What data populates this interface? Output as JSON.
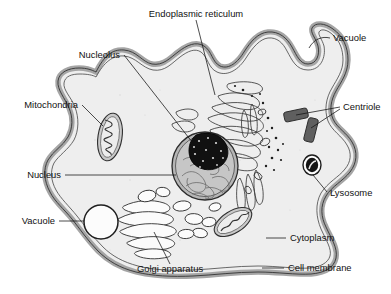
{
  "diagram": {
    "background_color": "#ffffff",
    "cytoplasm_color": "#eeeeee",
    "membrane_color": "#9a9a9a",
    "outline_color": "#333333",
    "nucleolus_color": "#111111",
    "nucleus_color": "#b9b9b9"
  },
  "labels": {
    "endoplasmic_reticulum": "Endoplasmic reticulum",
    "nucleolus": "Nucleolus",
    "mitochondria": "Mitochondria",
    "nucleus": "Nucleus",
    "vacuole_left": "Vacuole",
    "golgi_apparatus": "Golgi apparatus",
    "vacuole_top": "Vacuole",
    "centriole": "Centriole",
    "lysosome": "Lysosome",
    "cytoplasm": "Cytoplasm",
    "cell_membrane": "Cell membrane"
  },
  "parts": [
    {
      "id": "endoplasmic-reticulum",
      "label": "Endoplasmic reticulum",
      "label_x": 196,
      "label_y": 14,
      "anchor": "middle"
    },
    {
      "id": "nucleolus",
      "label": "Nucleolus",
      "label_x": 120,
      "label_y": 58,
      "anchor": "end"
    },
    {
      "id": "mitochondria",
      "label": "Mitochondria",
      "label_x": 78,
      "label_y": 108,
      "anchor": "end"
    },
    {
      "id": "nucleus",
      "label": "Nucleus",
      "label_x": 61,
      "label_y": 178,
      "anchor": "end"
    },
    {
      "id": "vacuole-left",
      "label": "Vacuole",
      "label_x": 55,
      "label_y": 224,
      "anchor": "end"
    },
    {
      "id": "golgi-apparatus",
      "label": "Golgi apparatus",
      "label_x": 170,
      "label_y": 272,
      "anchor": "middle"
    },
    {
      "id": "vacuole-top",
      "label": "Vacuole",
      "label_x": 333,
      "label_y": 41,
      "anchor": "start"
    },
    {
      "id": "centriole",
      "label": "Centriole",
      "label_x": 343,
      "label_y": 110,
      "anchor": "start"
    },
    {
      "id": "lysosome",
      "label": "Lysosome",
      "label_x": 330,
      "label_y": 196,
      "anchor": "start"
    },
    {
      "id": "cytoplasm",
      "label": "Cytoplasm",
      "label_x": 290,
      "label_y": 241,
      "anchor": "start"
    },
    {
      "id": "cell-membrane",
      "label": "Cell membrane",
      "label_x": 288,
      "label_y": 271,
      "anchor": "start"
    }
  ]
}
